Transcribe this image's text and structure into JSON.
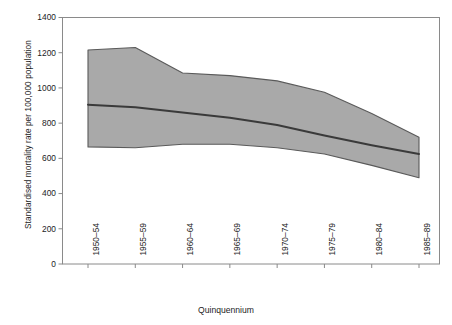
{
  "chart_data": {
    "type": "area",
    "title": "",
    "xlabel": "Quinquennium",
    "ylabel": "Standardised mortality rate per 100,000 population",
    "categories": [
      "1950–54",
      "1955–59",
      "1960–64",
      "1965–69",
      "1970–74",
      "1975–79",
      "1980–84",
      "1985–89"
    ],
    "ylim": [
      0,
      1400
    ],
    "yticks": [
      0,
      200,
      400,
      600,
      800,
      1000,
      1200,
      1400
    ],
    "ytick_labels": [
      "0",
      "200",
      "400",
      "600",
      "800",
      "1000",
      "1200",
      "1400"
    ],
    "grid": false,
    "legend": "none",
    "series": [
      {
        "name": "Upper bound",
        "values": [
          1215,
          1230,
          1085,
          1070,
          1040,
          975,
          855,
          720
        ]
      },
      {
        "name": "Median",
        "values": [
          905,
          890,
          860,
          830,
          790,
          730,
          675,
          625
        ]
      },
      {
        "name": "Lower bound",
        "values": [
          665,
          660,
          680,
          680,
          660,
          625,
          560,
          490
        ]
      }
    ],
    "band_fill_color": "#a9a9a9",
    "band_edge_color": "#555555",
    "median_line_color": "#3a3a3a",
    "axis_color": "#808080"
  },
  "axes": {
    "y_title": "Standardised mortality rate per 100,000 population",
    "x_title": "Quinquennium"
  }
}
